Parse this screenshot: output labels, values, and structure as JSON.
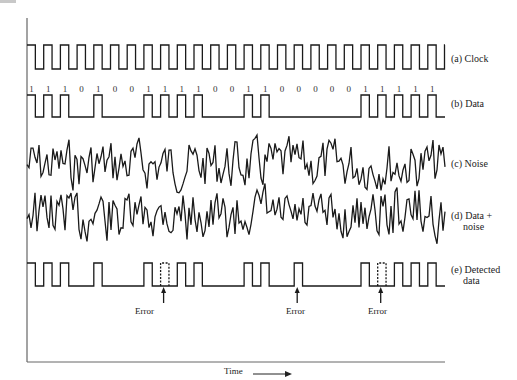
{
  "figure": {
    "time_label": "Time",
    "bits": [
      "1",
      "1",
      "1",
      "0",
      "1",
      "0",
      "0",
      "1",
      "1",
      "1",
      "1",
      "0",
      "0",
      "1",
      "1",
      "0",
      "0",
      "0",
      "0",
      "0",
      "1",
      "1",
      "1",
      "1",
      "1",
      "0",
      "0"
    ],
    "rows": [
      {
        "id": "clock",
        "label": "(a) Clock"
      },
      {
        "id": "data",
        "label": "(b) Data"
      },
      {
        "id": "noise",
        "label": "(c) Noise"
      },
      {
        "id": "data_noise",
        "label_line1": "(d) Data +",
        "label_line2": "noise"
      },
      {
        "id": "detected",
        "label_line1": "(e) Detected",
        "label_line2": "data"
      }
    ],
    "error_label": "Error",
    "errors": [
      {
        "bit_index": 8,
        "type": "missed pulse (dashed)"
      },
      {
        "bit_index": 16,
        "type": "false pulse"
      },
      {
        "bit_index": 21,
        "type": "missed pulse (dashed)"
      }
    ],
    "colors": {
      "line": "#1a1a1a",
      "axis": "#555555",
      "background": "#ffffff"
    }
  }
}
